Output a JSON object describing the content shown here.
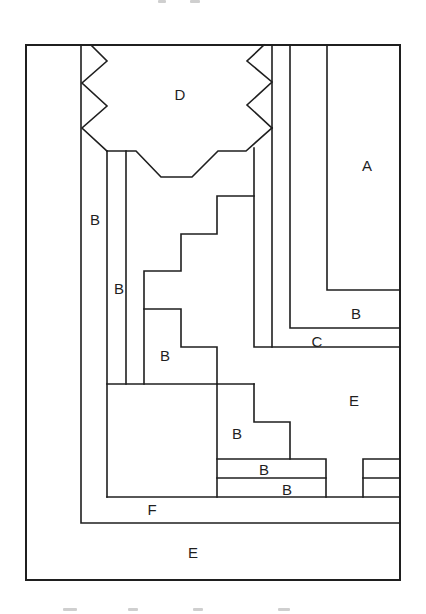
{
  "figure": {
    "stroke_color": "#1f1f1f",
    "background": "#ffffff",
    "outer_frame": {
      "x": 26,
      "y": 45,
      "w": 374,
      "h": 535
    },
    "polylines": [
      {
        "name": "inner-left-border",
        "points": [
          [
            81,
            45
          ],
          [
            81,
            523
          ],
          [
            400,
            523
          ]
        ]
      },
      {
        "name": "d-left-zigzag",
        "points": [
          [
            91,
            45
          ],
          [
            107,
            61
          ],
          [
            82,
            83
          ],
          [
            107,
            106
          ],
          [
            82,
            128
          ],
          [
            107,
            151
          ]
        ]
      },
      {
        "name": "d-bottom-edge",
        "points": [
          [
            107,
            151
          ],
          [
            136,
            151
          ],
          [
            161,
            177
          ],
          [
            192,
            177
          ],
          [
            218,
            151
          ],
          [
            246,
            151
          ],
          [
            272,
            128
          ]
        ]
      },
      {
        "name": "d-right-zigzag",
        "points": [
          [
            264,
            45
          ],
          [
            247,
            61
          ],
          [
            272,
            82
          ],
          [
            247,
            105
          ],
          [
            272,
            128
          ]
        ]
      },
      {
        "name": "b-left-strip-inner",
        "points": [
          [
            107,
            151
          ],
          [
            107,
            497
          ]
        ]
      },
      {
        "name": "b-left-strip-divider",
        "points": [
          [
            126,
            151
          ],
          [
            126,
            384
          ]
        ]
      },
      {
        "name": "staircase-left-wall",
        "points": [
          [
            144,
            384
          ],
          [
            144,
            271
          ],
          [
            181,
            271
          ],
          [
            181,
            234
          ],
          [
            217,
            234
          ],
          [
            217,
            196
          ],
          [
            254,
            196
          ]
        ]
      },
      {
        "name": "c-left-wall",
        "points": [
          [
            254,
            148
          ],
          [
            254,
            347
          ],
          [
            400,
            347
          ]
        ]
      },
      {
        "name": "c-inner-wall",
        "points": [
          [
            272,
            45
          ],
          [
            272,
            347
          ]
        ]
      },
      {
        "name": "b-upper-right-outline",
        "points": [
          [
            290,
            45
          ],
          [
            290,
            328
          ],
          [
            400,
            328
          ]
        ]
      },
      {
        "name": "a-box-outline",
        "points": [
          [
            327,
            45
          ],
          [
            327,
            290
          ],
          [
            400,
            290
          ]
        ]
      },
      {
        "name": "b-lower-staircase",
        "points": [
          [
            144,
            309
          ],
          [
            181,
            309
          ],
          [
            181,
            347
          ],
          [
            217,
            347
          ],
          [
            217,
            384
          ]
        ]
      },
      {
        "name": "square-top-edge",
        "points": [
          [
            107,
            384
          ],
          [
            254,
            384
          ]
        ]
      },
      {
        "name": "e-staircase",
        "points": [
          [
            217,
            384
          ],
          [
            217,
            497
          ]
        ]
      },
      {
        "name": "e-step",
        "points": [
          [
            254,
            384
          ],
          [
            254,
            422
          ],
          [
            290,
            422
          ],
          [
            290,
            459
          ]
        ]
      },
      {
        "name": "b-strips-outline",
        "points": [
          [
            217,
            459
          ],
          [
            326,
            459
          ],
          [
            326,
            497
          ]
        ]
      },
      {
        "name": "b-strips-divider",
        "points": [
          [
            217,
            478
          ],
          [
            326,
            478
          ]
        ]
      },
      {
        "name": "right-strips-outline",
        "points": [
          [
            363,
            497
          ],
          [
            363,
            459
          ],
          [
            400,
            459
          ]
        ]
      },
      {
        "name": "right-strips-divider",
        "points": [
          [
            363,
            478
          ],
          [
            400,
            478
          ]
        ]
      },
      {
        "name": "f-top-edge",
        "points": [
          [
            107,
            497
          ],
          [
            400,
            497
          ]
        ]
      }
    ],
    "labels": [
      {
        "name": "label-d",
        "text": "D",
        "x": 180,
        "y": 94
      },
      {
        "name": "label-a",
        "text": "A",
        "x": 367,
        "y": 165
      },
      {
        "name": "label-b-left-strip",
        "text": "B",
        "x": 95,
        "y": 219
      },
      {
        "name": "label-b-inner-strip",
        "text": "B",
        "x": 119,
        "y": 288
      },
      {
        "name": "label-b-upper-right",
        "text": "B",
        "x": 356,
        "y": 313
      },
      {
        "name": "label-c",
        "text": "C",
        "x": 317,
        "y": 341
      },
      {
        "name": "label-b-stair",
        "text": "B",
        "x": 165,
        "y": 355
      },
      {
        "name": "label-e-right",
        "text": "E",
        "x": 354,
        "y": 400
      },
      {
        "name": "label-b-lower-stair",
        "text": "B",
        "x": 237,
        "y": 433
      },
      {
        "name": "label-b-strip-upper",
        "text": "B",
        "x": 264,
        "y": 469
      },
      {
        "name": "label-b-strip-lower",
        "text": "B",
        "x": 287,
        "y": 489
      },
      {
        "name": "label-f",
        "text": "F",
        "x": 152,
        "y": 509
      },
      {
        "name": "label-e-bottom",
        "text": "E",
        "x": 193,
        "y": 552
      }
    ]
  },
  "caption_top_fragments": [
    {
      "x": 158,
      "w": 8
    },
    {
      "x": 190,
      "w": 10
    }
  ],
  "caption_bottom_fragments": [
    {
      "x": 63,
      "w": 14
    },
    {
      "x": 128,
      "w": 10
    },
    {
      "x": 193,
      "w": 10
    },
    {
      "x": 278,
      "w": 12
    }
  ]
}
